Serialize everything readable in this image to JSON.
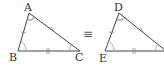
{
  "diagram": {
    "type": "congruent-triangles",
    "relation_symbol": "≡",
    "triangle1": {
      "vertices": {
        "A": "A",
        "B": "B",
        "C": "C"
      },
      "marks": {
        "AB": "single tick",
        "AC": "single tick (x-style)",
        "BC": "double tick"
      },
      "angles": {
        "A": "double arc",
        "B": "single arc",
        "C": "single arc"
      }
    },
    "triangle2": {
      "vertices": {
        "D": "D",
        "E": "E"
      },
      "marks": {
        "DE": "single tick",
        "DF": "single tick (x-style)",
        "EF": "double tick"
      },
      "angles": {
        "D": "double arc",
        "E": "single arc",
        "F": "single arc"
      }
    },
    "colors": {
      "line": "#444444",
      "mark": "#888888",
      "label": "#333333"
    }
  }
}
